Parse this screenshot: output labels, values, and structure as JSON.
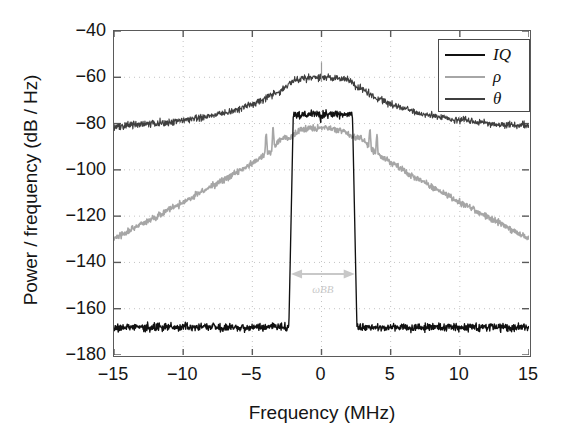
{
  "chart_data": {
    "type": "line",
    "title": "",
    "xlabel": "Frequency (MHz)",
    "ylabel": "Power / frequency (dB / Hz)",
    "xlim": [
      -15,
      15
    ],
    "ylim": [
      -180,
      -40
    ],
    "xticks": [
      "-15",
      "-10",
      "-5",
      "0",
      "5",
      "10",
      "15"
    ],
    "xtick_values": [
      -15,
      -10,
      -5,
      0,
      5,
      10,
      15
    ],
    "yticks": [
      "-40",
      "-60",
      "-80",
      "-100",
      "-120",
      "-140",
      "-160",
      "-180"
    ],
    "ytick_values": [
      -40,
      -60,
      -80,
      -100,
      -120,
      -140,
      -160,
      -180
    ],
    "grid": true,
    "grid_style": "dotted",
    "legend_position": "top-right",
    "series": [
      {
        "name": "IQ",
        "color": "#111111",
        "description": "Flat passband near -76 dB/Hz between about -2.2 and +2.4 MHz, steep skirts down to a noise floor near -168 dB/Hz",
        "passband_level": -76,
        "noise_floor": -168,
        "band_edges": [
          -2.2,
          2.4
        ]
      },
      {
        "name": "rho",
        "color": "#a6a6a6",
        "description": "Peak near -82 dB/Hz at center, rolling off to about -129 dB/Hz at the band edges, with small spurs near -3.5 and +4 MHz",
        "peak_level": -82,
        "edge_level": -129,
        "spurs": [
          -3.5,
          4.0
        ]
      },
      {
        "name": "theta",
        "color": "#3f3f3f",
        "description": "Peak near -60 dB/Hz at center, rolling off to about -82 dB/Hz at +/-15 MHz, with a narrow carrier spike at 0 MHz",
        "peak_level": -60,
        "edge_level": -82,
        "carrier_spike_freq": 0
      }
    ],
    "annotation": {
      "label": "ωBB",
      "type": "double-arrow",
      "x_start": -2.2,
      "x_end": 2.4,
      "y": -145
    }
  },
  "legend": {
    "entries": [
      {
        "label": "IQ",
        "color": "#111111"
      },
      {
        "label": "ρ",
        "color": "#a6a6a6"
      },
      {
        "label": "θ",
        "color": "#3f3f3f"
      }
    ]
  },
  "colors": {
    "axis": "#5a5a5a",
    "text": "#151515",
    "grid": "#c4c4c4",
    "background": "#ffffff",
    "annotation": "#c8c8c8"
  }
}
